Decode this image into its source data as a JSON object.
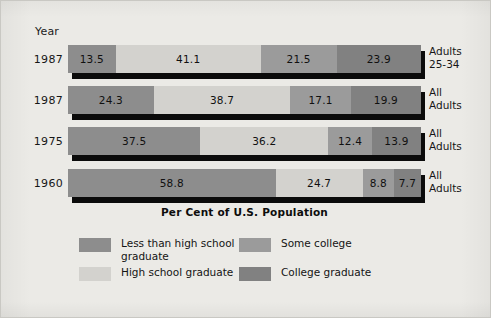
{
  "figure": {
    "background_color": "#ebeae6",
    "year_header": "Year",
    "axis_title": "Per Cent of U.S. Population"
  },
  "chart_data": {
    "type": "bar",
    "orientation": "horizontal",
    "stacked": true,
    "stack_mode": "percent",
    "title": "",
    "subtitle": "",
    "xlabel": "Per Cent of U.S. Population",
    "ylabel": "Year",
    "xlim": [
      0,
      100
    ],
    "grid": false,
    "legend_position": "bottom",
    "categories": [
      "1987",
      "1987",
      "1975",
      "1960"
    ],
    "row_group_labels": [
      "Adults 25-34",
      "All Adults",
      "All Adults",
      "All Adults"
    ],
    "series": [
      {
        "name": "Less than high school graduate",
        "color": "#8d8d8d",
        "values": [
          13.5,
          24.3,
          37.5,
          58.8
        ]
      },
      {
        "name": "High school graduate",
        "color": "#d3d2ce",
        "values": [
          41.1,
          38.7,
          36.2,
          24.7
        ]
      },
      {
        "name": "Some college",
        "color": "#9b9b9b",
        "values": [
          21.5,
          17.1,
          12.4,
          8.8
        ]
      },
      {
        "name": "College graduate",
        "color": "#818181",
        "values": [
          23.9,
          19.9,
          13.9,
          7.7
        ]
      }
    ]
  },
  "rows": [
    {
      "year": "1987",
      "group_label": "Adults\n25-34",
      "segments": [
        {
          "label": "13.5",
          "value": 13.5,
          "color": "#8d8d8d"
        },
        {
          "label": "41.1",
          "value": 41.1,
          "color": "#d3d2ce"
        },
        {
          "label": "21.5",
          "value": 21.5,
          "color": "#9b9b9b"
        },
        {
          "label": "23.9",
          "value": 23.9,
          "color": "#818181"
        }
      ]
    },
    {
      "year": "1987",
      "group_label": "All\nAdults",
      "segments": [
        {
          "label": "24.3",
          "value": 24.3,
          "color": "#8d8d8d"
        },
        {
          "label": "38.7",
          "value": 38.7,
          "color": "#d3d2ce"
        },
        {
          "label": "17.1",
          "value": 17.1,
          "color": "#9b9b9b"
        },
        {
          "label": "19.9",
          "value": 19.9,
          "color": "#818181"
        }
      ]
    },
    {
      "year": "1975",
      "group_label": "All\nAdults",
      "segments": [
        {
          "label": "37.5",
          "value": 37.5,
          "color": "#8d8d8d"
        },
        {
          "label": "36.2",
          "value": 36.2,
          "color": "#d3d2ce"
        },
        {
          "label": "12.4",
          "value": 12.4,
          "color": "#9b9b9b"
        },
        {
          "label": "13.9",
          "value": 13.9,
          "color": "#818181"
        }
      ]
    },
    {
      "year": "1960",
      "group_label": "All\nAdults",
      "segments": [
        {
          "label": "58.8",
          "value": 58.8,
          "color": "#8d8d8d"
        },
        {
          "label": "24.7",
          "value": 24.7,
          "color": "#d3d2ce"
        },
        {
          "label": "8.8",
          "value": 8.8,
          "color": "#9b9b9b"
        },
        {
          "label": "7.7",
          "value": 7.7,
          "color": "#818181"
        }
      ]
    }
  ],
  "legend": {
    "items": [
      {
        "label": "Less than high school\ngraduate",
        "color": "#8d8d8d"
      },
      {
        "label": "High school graduate",
        "color": "#d3d2ce"
      },
      {
        "label": "Some college",
        "color": "#9b9b9b"
      },
      {
        "label": "College graduate",
        "color": "#818181"
      }
    ]
  }
}
